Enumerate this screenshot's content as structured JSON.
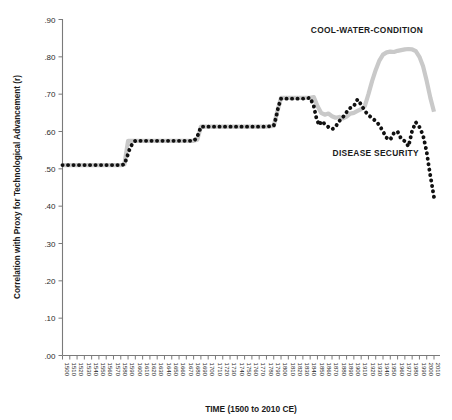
{
  "chart_data": {
    "type": "line",
    "title": "",
    "xlabel": "TIME (1500 to 2010 CE)",
    "ylabel": "Correlation with Proxy for Technological Advancement (r)",
    "xlim": [
      1500,
      2010
    ],
    "ylim": [
      0.0,
      0.9
    ],
    "grid": false,
    "legend_position": "inline-annotations",
    "y_ticks": [
      ".00",
      ".10",
      ".20",
      ".30",
      ".40",
      ".50",
      ".60",
      ".70",
      ".80",
      ".90"
    ],
    "y_tick_values": [
      0.0,
      0.1,
      0.2,
      0.3,
      0.4,
      0.5,
      0.6,
      0.7,
      0.8,
      0.9
    ],
    "x_ticks": [
      "1500",
      "1510",
      "1520",
      "1530",
      "1540",
      "1550",
      "1560",
      "1570",
      "1580",
      "1590",
      "1600",
      "1610",
      "1620",
      "1630",
      "1640",
      "1650",
      "1660",
      "1670",
      "1680",
      "1690",
      "1700",
      "1710",
      "1720",
      "1730",
      "1740",
      "1750",
      "1760",
      "1770",
      "1780",
      "1790",
      "1800",
      "1810",
      "1820",
      "1830",
      "1840",
      "1850",
      "1860",
      "1870",
      "1880",
      "1890",
      "1900",
      "1910",
      "1920",
      "1930",
      "1940",
      "1950",
      "1960",
      "1970",
      "1980",
      "1990",
      "2000",
      "2010"
    ],
    "annotations": [
      {
        "name": "cool-water-condition-label",
        "text": "COOL-WATER-CONDITION",
        "x": 1918,
        "y": 0.865,
        "color": "#1a1a1a"
      },
      {
        "name": "disease-security-label",
        "text": "DISEASE  SECURITY",
        "x": 1930,
        "y": 0.535,
        "color": "#1a1a1a"
      }
    ],
    "series": [
      {
        "name": "COOL-WATER-CONDITION",
        "style": "solid-thick",
        "color": "#c9c9c9",
        "x": [
          1500,
          1510,
          1520,
          1530,
          1540,
          1550,
          1560,
          1570,
          1580,
          1585,
          1590,
          1600,
          1610,
          1620,
          1630,
          1640,
          1650,
          1660,
          1670,
          1680,
          1685,
          1690,
          1700,
          1710,
          1720,
          1730,
          1740,
          1750,
          1760,
          1770,
          1780,
          1790,
          1795,
          1800,
          1810,
          1820,
          1830,
          1840,
          1845,
          1850,
          1855,
          1860,
          1865,
          1870,
          1875,
          1880,
          1885,
          1890,
          1895,
          1900,
          1905,
          1910,
          1915,
          1920,
          1925,
          1930,
          1935,
          1940,
          1945,
          1950,
          1955,
          1960,
          1965,
          1970,
          1975,
          1980,
          1985,
          1990,
          1995,
          2000,
          2005,
          2010
        ],
        "values": [
          0.51,
          0.51,
          0.51,
          0.51,
          0.51,
          0.51,
          0.51,
          0.51,
          0.51,
          0.512,
          0.575,
          0.575,
          0.575,
          0.575,
          0.575,
          0.575,
          0.575,
          0.575,
          0.575,
          0.575,
          0.578,
          0.613,
          0.613,
          0.613,
          0.613,
          0.613,
          0.613,
          0.613,
          0.613,
          0.613,
          0.613,
          0.615,
          0.655,
          0.69,
          0.69,
          0.69,
          0.69,
          0.69,
          0.692,
          0.668,
          0.65,
          0.645,
          0.648,
          0.641,
          0.637,
          0.639,
          0.635,
          0.64,
          0.648,
          0.65,
          0.655,
          0.66,
          0.668,
          0.7,
          0.735,
          0.765,
          0.79,
          0.806,
          0.812,
          0.814,
          0.813,
          0.816,
          0.818,
          0.82,
          0.821,
          0.82,
          0.815,
          0.8,
          0.775,
          0.735,
          0.69,
          0.653
        ]
      },
      {
        "name": "DISEASE SECURITY",
        "style": "dotted",
        "color": "#111111",
        "x": [
          1500,
          1510,
          1520,
          1530,
          1540,
          1550,
          1560,
          1570,
          1580,
          1585,
          1588,
          1592,
          1596,
          1600,
          1610,
          1620,
          1630,
          1640,
          1650,
          1660,
          1670,
          1680,
          1684,
          1687,
          1690,
          1700,
          1710,
          1720,
          1730,
          1740,
          1750,
          1760,
          1770,
          1780,
          1790,
          1793,
          1796,
          1800,
          1810,
          1820,
          1830,
          1840,
          1845,
          1848,
          1852,
          1856,
          1860,
          1865,
          1870,
          1875,
          1878,
          1882,
          1886,
          1890,
          1895,
          1900,
          1905,
          1910,
          1915,
          1920,
          1925,
          1930,
          1935,
          1940,
          1945,
          1950,
          1955,
          1960,
          1965,
          1970,
          1975,
          1980,
          1985,
          1990,
          1995,
          2000,
          2003,
          2006,
          2010
        ],
        "values": [
          0.51,
          0.51,
          0.51,
          0.51,
          0.51,
          0.51,
          0.51,
          0.51,
          0.51,
          0.512,
          0.528,
          0.552,
          0.568,
          0.575,
          0.575,
          0.575,
          0.575,
          0.575,
          0.575,
          0.575,
          0.575,
          0.575,
          0.582,
          0.596,
          0.613,
          0.613,
          0.613,
          0.613,
          0.613,
          0.613,
          0.613,
          0.613,
          0.613,
          0.613,
          0.615,
          0.636,
          0.664,
          0.688,
          0.688,
          0.688,
          0.688,
          0.69,
          0.668,
          0.64,
          0.617,
          0.628,
          0.62,
          0.612,
          0.606,
          0.612,
          0.624,
          0.632,
          0.641,
          0.652,
          0.663,
          0.668,
          0.686,
          0.672,
          0.655,
          0.644,
          0.636,
          0.628,
          0.617,
          0.6,
          0.583,
          0.578,
          0.596,
          0.6,
          0.58,
          0.574,
          0.56,
          0.602,
          0.625,
          0.612,
          0.59,
          0.545,
          0.505,
          0.47,
          0.424
        ]
      }
    ]
  },
  "axes": {
    "y_axis_name": "y-axis",
    "x_axis_name": "x-axis"
  }
}
